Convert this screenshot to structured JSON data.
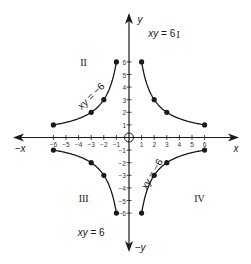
{
  "chart_data": {
    "type": "line",
    "title": "",
    "xlabel": "x",
    "ylabel": "y",
    "xlim": [
      -6,
      6
    ],
    "ylim": [
      -6,
      6
    ],
    "grid": false,
    "axis_labels": {
      "pos_x": "x",
      "neg_x": "−x",
      "pos_y": "y",
      "neg_y": "−y"
    },
    "x_ticks": [
      -6,
      -5,
      -4,
      -3,
      -2,
      -1,
      1,
      2,
      3,
      4,
      5,
      6
    ],
    "y_ticks": [
      -6,
      -5,
      -4,
      -3,
      -2,
      -1,
      1,
      2,
      3,
      4,
      5,
      6
    ],
    "x_tick_labels": [
      "−6",
      "−5",
      "−4",
      "−3",
      "−2",
      "−1",
      "1",
      "2",
      "3",
      "4",
      "5",
      "6"
    ],
    "y_tick_labels": [
      "−6",
      "−5",
      "−4",
      "−3",
      "−2",
      "−1",
      "1",
      "2",
      "3",
      "4",
      "5",
      "6"
    ],
    "quadrants": [
      {
        "label": "I",
        "x": 3.9,
        "y": 8.2
      },
      {
        "label": "II",
        "x": -3.6,
        "y": 6.0
      },
      {
        "label": "III",
        "x": -3.6,
        "y": -4.8
      },
      {
        "label": "IV",
        "x": 5.6,
        "y": -4.8
      }
    ],
    "series": [
      {
        "name": "xy = 6 (Quadrant I)",
        "equation": "xy = 6",
        "points": [
          [
            1,
            6
          ],
          [
            2,
            3
          ],
          [
            3,
            2
          ],
          [
            6,
            1
          ]
        ]
      },
      {
        "name": "xy = −6 (Quadrant II)",
        "equation": "xy = −6",
        "points": [
          [
            -1,
            6
          ],
          [
            -2,
            3
          ],
          [
            -3,
            2
          ],
          [
            -6,
            1
          ]
        ]
      },
      {
        "name": "xy = 6 (Quadrant III)",
        "equation": "xy = 6",
        "points": [
          [
            -1,
            -6
          ],
          [
            -2,
            -3
          ],
          [
            -3,
            -2
          ],
          [
            -6,
            -1
          ]
        ]
      },
      {
        "name": "xy = −6 (Quadrant IV)",
        "equation": "xy = −6",
        "points": [
          [
            1,
            -6
          ],
          [
            2,
            -3
          ],
          [
            3,
            -2
          ],
          [
            6,
            -1
          ]
        ]
      }
    ],
    "annotations": [
      {
        "text": "xy = 6",
        "x": 2.6,
        "y": 8.3,
        "rotate": 0
      },
      {
        "text": "xy = −6",
        "x": -3.0,
        "y": 3.3,
        "rotate": -45
      },
      {
        "text": "xy = 6",
        "x": -3.0,
        "y": -7.5,
        "rotate": 0
      },
      {
        "text": "xy = −6",
        "x": 1.8,
        "y": -2.9,
        "rotate": -60
      }
    ]
  },
  "colors": {
    "ink": "#1a1a1a",
    "background": "#ffffff"
  }
}
